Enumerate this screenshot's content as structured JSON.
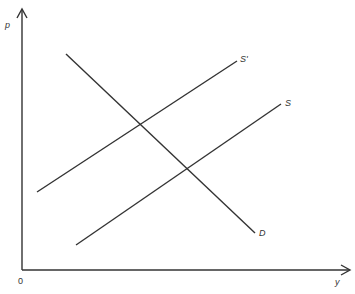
{
  "diagram": {
    "type": "supply-demand",
    "axes": {
      "y_label": "p",
      "x_label": "y",
      "origin_label": "0"
    },
    "lines": [
      {
        "name": "D",
        "label": "D",
        "x1": 66,
        "y1": 54,
        "x2": 255,
        "y2": 233
      },
      {
        "name": "S'",
        "label": "S'",
        "x1": 37,
        "y1": 192,
        "x2": 237,
        "y2": 61
      },
      {
        "name": "S",
        "label": "S",
        "x1": 76,
        "y1": 245,
        "x2": 281,
        "y2": 104
      }
    ],
    "line_color": "#333333"
  }
}
